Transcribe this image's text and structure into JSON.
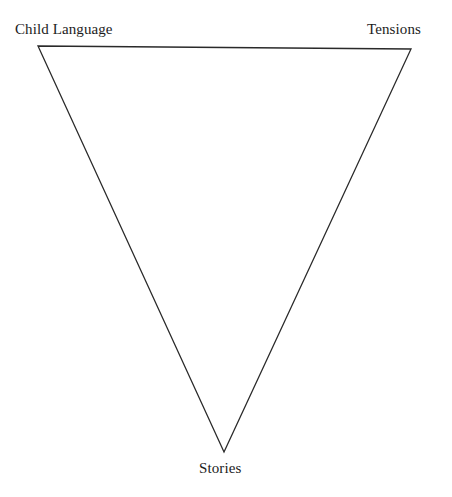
{
  "diagram": {
    "type": "inverted-triangle",
    "background_color": "#ffffff",
    "stroke_color": "#2a2a2a",
    "stroke_width": 1.3,
    "fill": "none",
    "vertices": [
      {
        "id": "top-left",
        "label": "Child Language",
        "x": 38,
        "y": 46
      },
      {
        "id": "top-right",
        "label": "Tensions",
        "x": 411,
        "y": 49
      },
      {
        "id": "bottom",
        "label": "Stories",
        "x": 224,
        "y": 452
      }
    ],
    "edges": [
      {
        "from": "top-left",
        "to": "top-right"
      },
      {
        "from": "top-right",
        "to": "bottom"
      },
      {
        "from": "bottom",
        "to": "top-left"
      }
    ],
    "path": "M 38 46 L 411 49 L 224 452 Z",
    "labels": {
      "top_left": "Child Language",
      "top_right": "Tensions",
      "bottom": "Stories"
    }
  }
}
